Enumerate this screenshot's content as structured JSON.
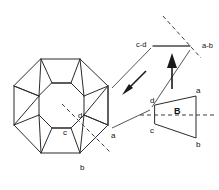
{
  "figure": {
    "labels": {
      "octagon_a": "a",
      "octagon_b": "b",
      "octagon_c": "c",
      "octagon_d": "d",
      "trapezoid_a": "a",
      "trapezoid_b": "b",
      "trapezoid_c": "c",
      "trapezoid_d": "d",
      "trapezoid_interior": "B",
      "edge_cd": "c-d",
      "edge_ab": "a-b"
    },
    "colors": {
      "stroke": "#2b2b2b",
      "dashed": "#3a3a3a",
      "connector": "#555555",
      "arrow": "#1a1a1a",
      "background": "#ffffff",
      "text": "#111111"
    },
    "icons": {
      "arrow_down_left": "arrow-down-left-icon",
      "arrow_up": "arrow-up-icon"
    }
  }
}
